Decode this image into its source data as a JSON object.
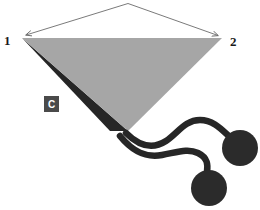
{
  "figure": {
    "name": "cone-with-two-spheres-diagram",
    "background_color": "#ffffff",
    "width": 260,
    "height": 210
  },
  "colors": {
    "cone_face": "#a6a6a6",
    "cone_shadow_edge": "#262626",
    "sphere": "#2b2b2b",
    "connector": "#262626",
    "arrow": "#6b6b6b",
    "label_text": "#1a1a1a",
    "badge_fill": "#4a4a4a",
    "badge_text": "#ffffff"
  },
  "labels": {
    "vertex_left": "1",
    "vertex_right": "2",
    "badge_c": "C"
  },
  "annotations": {
    "arrow_left": {
      "name": "span-arrow-to-vertex-1",
      "from_x": 128,
      "from_y": 3,
      "to_x": 23,
      "to_y": 37
    },
    "arrow_right": {
      "name": "span-arrow-to-vertex-2",
      "from_x": 128,
      "from_y": 3,
      "to_x": 221,
      "to_y": 38
    }
  },
  "cone": {
    "name": "gray-triangular-cone",
    "apex_left_x": 22,
    "apex_left_y": 38,
    "apex_right_x": 222,
    "apex_right_y": 38,
    "tip_x": 128,
    "tip_y": 131,
    "shadow_tip_x": 115,
    "shadow_tip_y": 131
  },
  "spheres": [
    {
      "name": "sphere-upper-right",
      "cx": 240,
      "cy": 148,
      "r": 18
    },
    {
      "name": "sphere-lower-left",
      "cx": 209,
      "cy": 188,
      "r": 18
    }
  ],
  "connectors": [
    {
      "name": "connector-upper",
      "stroke_width": 7
    },
    {
      "name": "connector-lower",
      "stroke_width": 7
    }
  ]
}
